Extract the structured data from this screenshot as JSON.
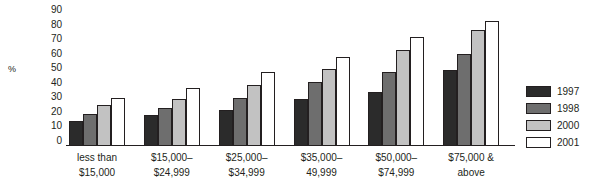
{
  "chart_data": {
    "type": "bar",
    "title": "",
    "xlabel": "",
    "ylabel": "%",
    "ylim": [
      0,
      90
    ],
    "ytick_step": 10,
    "yticks": [
      "90",
      "80",
      "70",
      "60",
      "50",
      "40",
      "30",
      "20",
      "10",
      "0"
    ],
    "grid": false,
    "legend_position": "right",
    "categories": [
      "less than\n$15,000",
      "$15,000–\n$24,999",
      "$25,000–\n$34,999",
      "$35,000–\n49,999",
      "$50,000–\n$74,999",
      "$75,000 &\nabove"
    ],
    "category_lines": [
      [
        "less than",
        "$15,000"
      ],
      [
        "$15,000–",
        "$24,999"
      ],
      [
        "$25,000–",
        "$34,999"
      ],
      [
        "$35,000–",
        "49,999"
      ],
      [
        "$50,000–",
        "$74,999"
      ],
      [
        "$75,000 &",
        "above"
      ]
    ],
    "series": [
      {
        "name": "1997",
        "color": "#2b2b2b",
        "values": [
          17,
          21,
          25,
          32,
          37,
          52
        ]
      },
      {
        "name": "1998",
        "color": "#6e6e6e",
        "values": [
          22,
          26,
          33,
          44,
          51,
          63
        ]
      },
      {
        "name": "2000",
        "color": "#c2c2c2",
        "values": [
          28,
          32,
          42,
          53,
          66,
          80
        ]
      },
      {
        "name": "2001",
        "color": "#ffffff",
        "values": [
          33,
          40,
          51,
          61,
          75,
          86
        ]
      }
    ]
  },
  "colors": {
    "ink": "#231f20",
    "background": "#ffffff",
    "series_1997": "#2b2b2b",
    "series_1998": "#6e6e6e",
    "series_2000": "#c2c2c2",
    "series_2001": "#ffffff"
  }
}
